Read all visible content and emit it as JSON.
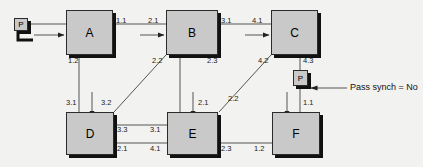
{
  "diagram": {
    "nodes": [
      {
        "id": "A",
        "label": "A"
      },
      {
        "id": "B",
        "label": "B"
      },
      {
        "id": "C",
        "label": "C"
      },
      {
        "id": "D",
        "label": "D"
      },
      {
        "id": "E",
        "label": "E"
      },
      {
        "id": "F",
        "label": "F"
      }
    ],
    "terminals": [
      {
        "id": "P-in",
        "label": "P"
      },
      {
        "id": "P-synch",
        "label": "P"
      }
    ],
    "annotation": {
      "text": "Pass synch = No"
    },
    "port_labels": [
      {
        "id": "a-out-right",
        "text": "1.1"
      },
      {
        "id": "b-in-left",
        "text": "2.1"
      },
      {
        "id": "b-out-right",
        "text": "3.1"
      },
      {
        "id": "c-in-left",
        "text": "4.1"
      },
      {
        "id": "a-out-bottom",
        "text": "1.2"
      },
      {
        "id": "b-out-bottomleft",
        "text": "2.2"
      },
      {
        "id": "b-out-bottom",
        "text": "2.3"
      },
      {
        "id": "c-out-bottomleft",
        "text": "4.2"
      },
      {
        "id": "c-out-bottom",
        "text": "4.3"
      },
      {
        "id": "d-in-topleft",
        "text": "3.1"
      },
      {
        "id": "d-in-topright",
        "text": "3.2"
      },
      {
        "id": "e-in-top",
        "text": "2.1"
      },
      {
        "id": "e-in-topright",
        "text": "2.2"
      },
      {
        "id": "f-in-top",
        "text": "1.1"
      },
      {
        "id": "d-out-upper",
        "text": "3.3"
      },
      {
        "id": "e-in-upper",
        "text": "3.1"
      },
      {
        "id": "d-in-lower",
        "text": "2.1"
      },
      {
        "id": "e-out-lower",
        "text": "4.1"
      },
      {
        "id": "e-out-right",
        "text": "2.3"
      },
      {
        "id": "f-in-left",
        "text": "1.2"
      }
    ],
    "colors": {
      "node_fill": "#c9c9c9",
      "node_border": "#2b2b2b",
      "shadow": "#111111",
      "line": "#555555",
      "background": "#f2f2f0",
      "text": "#111111"
    }
  }
}
